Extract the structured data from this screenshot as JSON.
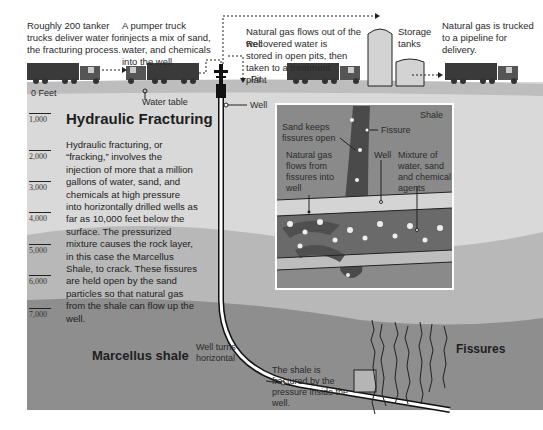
{
  "top_captions": {
    "tanker": "Roughly 200 tanker trucks deliver water for the fracturing process.",
    "pumper": "A pumper truck injects a mix of sand, water, and chemicals into the well",
    "gas_flows": "Natural gas flows out of the well",
    "recovered_water": "Recovered water is stored in open pits, then taken to a treatment plant",
    "storage": "Storage tanks",
    "trucked": "Natural gas is trucked to a pipeline for delivery."
  },
  "surface_labels": {
    "zero_feet": "0 Feet",
    "water_table": "Water table",
    "pit": "Pit",
    "well": "Well"
  },
  "depth_scale": [
    "1,000",
    "2,000",
    "3,000",
    "4,000",
    "5,000",
    "6,000",
    "7,000"
  ],
  "main": {
    "title": "Hydraulic Fracturing",
    "body": "Hydraulic fracturing, or “fracking,” involves the injection of more that a million gallons of water, sand, and chemicals at high pressure into horizontally drilled wells as far as 10,000 feet below the surface. The pressurized mixture causes the rock layer, in this case the Marcellus Shale, to crack. These fissures are held open by the sand particles so that natural gas from the shale can flow up the well."
  },
  "inset": {
    "shale": "Shale",
    "sand_keeps": "Sand keeps fissures open",
    "fissure": "Fissure",
    "gas_flows": "Natural gas flows from fissures into well",
    "well": "Well",
    "mixture": "Mixture of water, sand and chemical agents"
  },
  "bottom_labels": {
    "well_turns": "Well turns horizontal",
    "marcellus": "Marcellus shale",
    "fractured": "The shale is fractured by the pressure inside the well.",
    "fissures": "Fissures"
  },
  "colors": {
    "sky": "#ffffff",
    "ground_top": "#d6d6d6",
    "layer_mid": "#c8c8c8",
    "layer_deep": "#a8a8a8",
    "layer_shale": "#8f8f8f",
    "inset_bg": "#8a8a8a",
    "truck": "#3a3a3a"
  }
}
